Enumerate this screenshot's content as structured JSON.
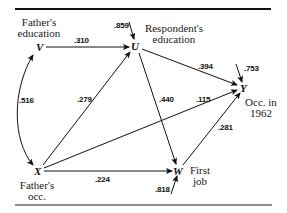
{
  "diagram": {
    "type": "path-diagram",
    "nodes": {
      "V": {
        "symbol": "V",
        "label_line1": "Father's",
        "label_line2": "education"
      },
      "X": {
        "symbol": "X",
        "label_line1": "Father's",
        "label_line2": "occ."
      },
      "U": {
        "symbol": "U",
        "label_line1": "Respondent's",
        "label_line2": "education"
      },
      "W": {
        "symbol": "W",
        "label_line1": "First",
        "label_line2": "job"
      },
      "Y": {
        "symbol": "Y",
        "label_line1": "Occ. in",
        "label_line2": "1962"
      }
    },
    "edges": [
      {
        "from": "V",
        "to": "U",
        "coefficient": ".310"
      },
      {
        "from": "X",
        "to": "U",
        "coefficient": ".279"
      },
      {
        "from": "V",
        "to": "X",
        "coefficient": ".516",
        "kind": "correlation"
      },
      {
        "from": "U",
        "to": "Y",
        "coefficient": ".394"
      },
      {
        "from": "U",
        "to": "W",
        "coefficient": ".440"
      },
      {
        "from": "X",
        "to": "Y",
        "coefficient": ".115"
      },
      {
        "from": "X",
        "to": "W",
        "coefficient": ".224"
      },
      {
        "from": "W",
        "to": "Y",
        "coefficient": ".281"
      }
    ],
    "residuals": {
      "U": ".859",
      "Y": ".753",
      "W": ".818"
    },
    "colors": {
      "ink": "#111111",
      "background": "#ffffff"
    }
  }
}
